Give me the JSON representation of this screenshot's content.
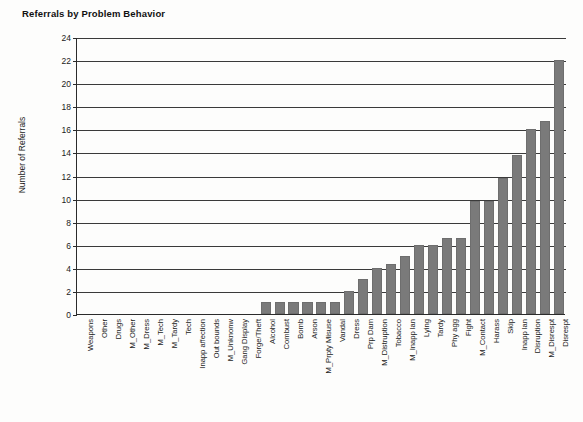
{
  "chart_data": {
    "type": "bar",
    "title": "Referrals by Problem Behavior",
    "xlabel": "",
    "ylabel": "Number of Referrals",
    "ylim": [
      0,
      24
    ],
    "ytick_step": 2,
    "yticks": [
      24,
      22,
      20,
      18,
      16,
      14,
      12,
      10,
      8,
      6,
      4,
      2,
      0
    ],
    "grid": true,
    "legend": "none",
    "bar_color": "#7a7a7a",
    "categories": [
      "Weapons",
      "Other",
      "Drugs",
      "M_Other",
      "M_Dress",
      "M_Tech",
      "M_Tardy",
      "Tech",
      "Inapp affection",
      "Out bounds",
      "M_Unknonw",
      "Gang Display",
      "Forge/Theft",
      "Alcohol",
      "Combust",
      "Bomb",
      "Arson",
      "M_Prpty Misuse",
      "Vandal",
      "Dress",
      "Prp Dam",
      "M_Distruption",
      "Tobacco",
      "M_Inapp lan",
      "Lying",
      "Tardy",
      "Phy agg",
      "Fight",
      "M_Contact",
      "Harass",
      "Skip",
      "Inapp lan",
      "Disruption",
      "M_Disrespt",
      "Disrespt"
    ],
    "values": [
      0,
      0,
      0,
      0,
      0,
      0,
      0,
      0,
      0,
      0,
      0,
      0,
      0,
      1,
      1,
      1,
      1,
      1,
      1,
      2,
      3,
      4,
      4.3,
      5,
      6,
      6,
      6.6,
      6.6,
      9.8,
      9.8,
      11.8,
      13.8,
      16,
      16.7,
      22
    ]
  }
}
